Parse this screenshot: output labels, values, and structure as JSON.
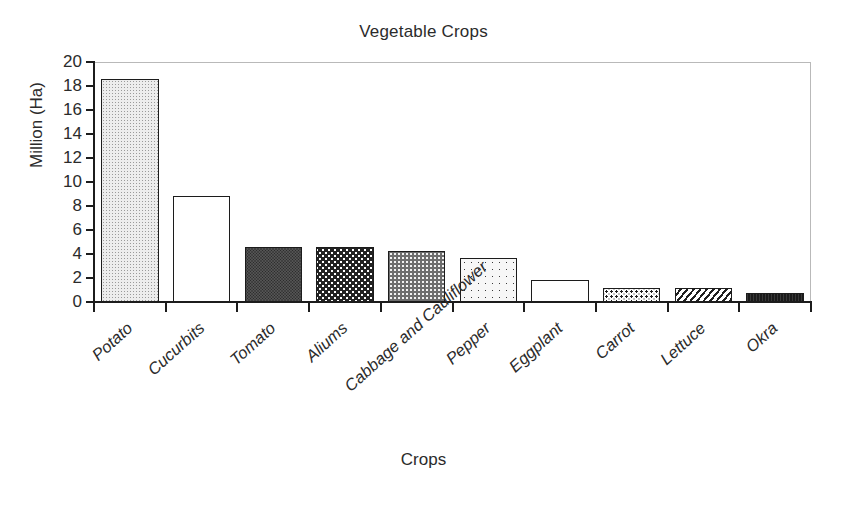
{
  "chart_data": {
    "type": "bar",
    "title": "Vegetable Crops",
    "xlabel": "Crops",
    "ylabel": "Million (Ha)",
    "categories": [
      "Potato",
      "Cucurbits",
      "Tomato",
      "Aliums",
      "Cabbage and Cauliflower",
      "Pepper",
      "Eggplant",
      "Carrot",
      "Lettuce",
      "Okra"
    ],
    "values": [
      18.6,
      8.8,
      4.6,
      4.6,
      4.25,
      3.7,
      1.8,
      1.2,
      1.15,
      0.75
    ],
    "ylim": [
      0,
      20
    ],
    "ytick_values": [
      0,
      2,
      4,
      6,
      8,
      10,
      12,
      14,
      16,
      18,
      20
    ],
    "ytick_labels": [
      "0",
      "2",
      "4",
      "6",
      "8",
      "10",
      "12",
      "14",
      "16",
      "18",
      "20"
    ],
    "grid": false,
    "legend": null,
    "bar_fills": [
      "dots-light",
      "empty",
      "solid-dark",
      "wave",
      "gray-dots",
      "dots-sparse",
      "empty",
      "speckle",
      "diag-hatch",
      "black"
    ],
    "colors": {
      "axis": "#1c1c1c",
      "text": "#2b2b2b",
      "frame": "#b9b9b9",
      "background": "#ffffff"
    }
  },
  "figure": {
    "title": "Vegetable Crops",
    "x_axis_title": "Crops",
    "y_axis_title": "Million (Ha)"
  }
}
